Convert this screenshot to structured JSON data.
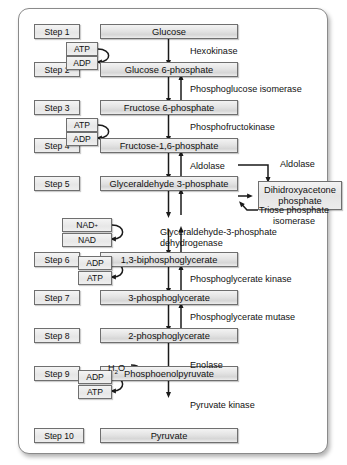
{
  "diagram": {
    "type": "flowchart",
    "frame_color": "#8a8a8a",
    "box_fill": "#e6e6e6",
    "line_color": "#1a1a1a"
  },
  "steps": [
    {
      "id": "step1",
      "label": "Step 1",
      "metabolite": "Glucose"
    },
    {
      "id": "step2",
      "label": "Step 2",
      "metabolite": "Glucose 6-phosphate"
    },
    {
      "id": "step3",
      "label": "Step 3",
      "metabolite": "Fructose 6-phosphate"
    },
    {
      "id": "step4",
      "label": "Step 4",
      "metabolite": "Fructose-1,6-phosphate"
    },
    {
      "id": "step5",
      "label": "Step 5",
      "metabolite": "Glyceraldehyde 3-phosphate"
    },
    {
      "id": "step6",
      "label": "Step 6",
      "metabolite": "1,3-biphosphoglycerate"
    },
    {
      "id": "step7",
      "label": "Step 7",
      "metabolite": "3-phosphoglycerate"
    },
    {
      "id": "step8",
      "label": "Step 8",
      "metabolite": "2-phosphoglycerate"
    },
    {
      "id": "step9",
      "label": "Step 9",
      "metabolite": "Phosphoenolpyruvate"
    },
    {
      "id": "step10",
      "label": "Step 10",
      "metabolite": "Pyruvate"
    }
  ],
  "enzymes": [
    {
      "id": "enz1",
      "name": "Hexokinase"
    },
    {
      "id": "enz2",
      "name": "Phosphoglucose isomerase"
    },
    {
      "id": "enz3",
      "name": "Phosphofructokinase"
    },
    {
      "id": "enz4",
      "name": "Aldolase"
    },
    {
      "id": "enz5",
      "name": "Aldolase"
    },
    {
      "id": "enz6",
      "name": "Triose phosphate isomerase"
    },
    {
      "id": "enz7_line1",
      "name": "Glyceraldehyde-3-phosphate"
    },
    {
      "id": "enz7_line2",
      "name": "dehydrogenase"
    },
    {
      "id": "enz8",
      "name": "Phosphoglycerate kinase"
    },
    {
      "id": "enz9",
      "name": "Phosphoglycerate mutase"
    },
    {
      "id": "enz10",
      "name": "Enolase"
    },
    {
      "id": "enz11",
      "name": "Pyruvate kinase"
    }
  ],
  "side_products": [
    {
      "id": "dhap_line1",
      "text": "Dihidroxyacetone"
    },
    {
      "id": "dhap_line2",
      "text": "phosphate"
    }
  ],
  "cofactors": [
    {
      "id": "cof1",
      "label": "ATP"
    },
    {
      "id": "cof2",
      "label": "ADP"
    },
    {
      "id": "cof3",
      "label": "ATP"
    },
    {
      "id": "cof4",
      "label": "ADP"
    },
    {
      "id": "cof5",
      "label": "NAD",
      "superscript": "+"
    },
    {
      "id": "cof6",
      "label": "NAD"
    },
    {
      "id": "cof7",
      "label": "ADP"
    },
    {
      "id": "cof8",
      "label": "ATP"
    },
    {
      "id": "cof9",
      "label": "ADP"
    },
    {
      "id": "cof10",
      "label": "ATP"
    }
  ],
  "small_molecules": [
    {
      "id": "water",
      "label": "H",
      "sub": "2",
      "tail": "O"
    }
  ]
}
